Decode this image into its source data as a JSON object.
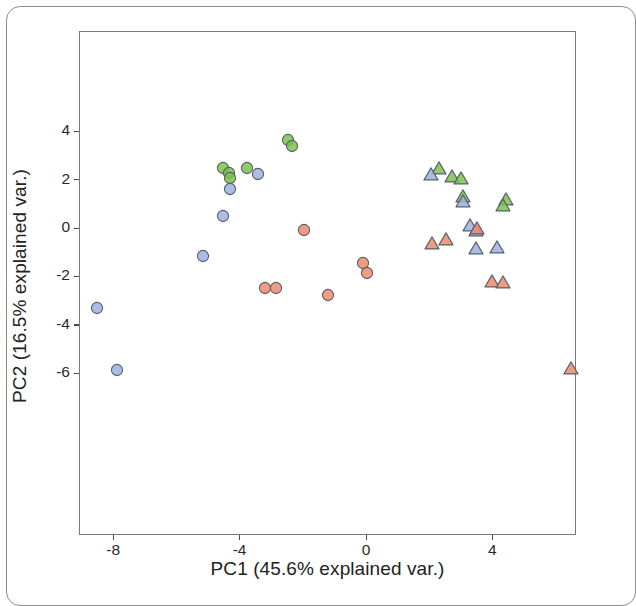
{
  "chart_data": {
    "type": "scatter",
    "title": "",
    "xlabel": "PC1 (45.6% explained var.)",
    "ylabel": "PC2 (16.5% explained var.)",
    "xlim": [
      -9.1,
      6.7
    ],
    "ylim": [
      -6.6,
      4.3
    ],
    "xticks": [
      -8,
      -4,
      0,
      4
    ],
    "xtick_labels": [
      "-8",
      "-4",
      "0",
      "4"
    ],
    "yticks": [
      4,
      2,
      0,
      -2,
      -4,
      -6
    ],
    "ytick_labels": [
      "4",
      "2",
      "0",
      "-2",
      "-4",
      "-6"
    ],
    "grid": false,
    "legend": "none",
    "colors": {
      "green": "#7cc24a",
      "blue": "#9db0e0",
      "orange": "#ef8b6a",
      "marker_stroke": "#55606e",
      "axis": "#4a4a4a",
      "frame": "#7a7a7a",
      "text": "#222222"
    },
    "marker_shapes": [
      "circle",
      "triangle"
    ],
    "series": [
      {
        "name": "green-circle",
        "color": "#7cc24a",
        "shape": "circle",
        "points": [
          {
            "x": -2.48,
            "y": 3.65
          },
          {
            "x": -2.35,
            "y": 3.4
          },
          {
            "x": -4.51,
            "y": 2.47
          },
          {
            "x": -4.35,
            "y": 2.29
          },
          {
            "x": -4.29,
            "y": 2.06
          },
          {
            "x": -3.78,
            "y": 2.47
          }
        ]
      },
      {
        "name": "blue-circle",
        "color": "#9db0e0",
        "shape": "circle",
        "points": [
          {
            "x": -3.43,
            "y": 2.22
          },
          {
            "x": -4.29,
            "y": 1.62
          },
          {
            "x": -4.51,
            "y": 0.5
          },
          {
            "x": -5.17,
            "y": -1.15
          },
          {
            "x": -8.51,
            "y": -3.29
          },
          {
            "x": -7.87,
            "y": -5.88
          }
        ]
      },
      {
        "name": "orange-circle",
        "color": "#ef8b6a",
        "shape": "circle",
        "points": [
          {
            "x": -1.97,
            "y": -0.08
          },
          {
            "x": -0.1,
            "y": -1.46
          },
          {
            "x": -3.21,
            "y": -2.48
          },
          {
            "x": -2.86,
            "y": -2.48
          },
          {
            "x": 0.03,
            "y": -1.85
          },
          {
            "x": -1.21,
            "y": -2.78
          }
        ]
      },
      {
        "name": "green-triangle",
        "color": "#7cc24a",
        "shape": "triangle",
        "points": [
          {
            "x": 2.32,
            "y": 2.5
          },
          {
            "x": 2.73,
            "y": 2.13
          },
          {
            "x": 3.02,
            "y": 2.05
          },
          {
            "x": 3.08,
            "y": 1.33
          },
          {
            "x": 4.44,
            "y": 1.2
          },
          {
            "x": 4.32,
            "y": 0.95
          }
        ]
      },
      {
        "name": "blue-triangle",
        "color": "#9db0e0",
        "shape": "triangle",
        "points": [
          {
            "x": 2.06,
            "y": 2.24
          },
          {
            "x": 3.08,
            "y": 1.1
          },
          {
            "x": 3.3,
            "y": 0.12
          },
          {
            "x": 3.49,
            "y": -0.08
          },
          {
            "x": 3.49,
            "y": -0.83
          },
          {
            "x": 4.13,
            "y": -0.79
          }
        ]
      },
      {
        "name": "orange-triangle",
        "color": "#ef8b6a",
        "shape": "triangle",
        "points": [
          {
            "x": 3.52,
            "y": -0.01
          },
          {
            "x": 2.1,
            "y": -0.62
          },
          {
            "x": 2.54,
            "y": -0.46
          },
          {
            "x": 4.0,
            "y": -2.17
          },
          {
            "x": 4.35,
            "y": -2.25
          },
          {
            "x": 6.48,
            "y": -5.79
          }
        ]
      }
    ]
  }
}
